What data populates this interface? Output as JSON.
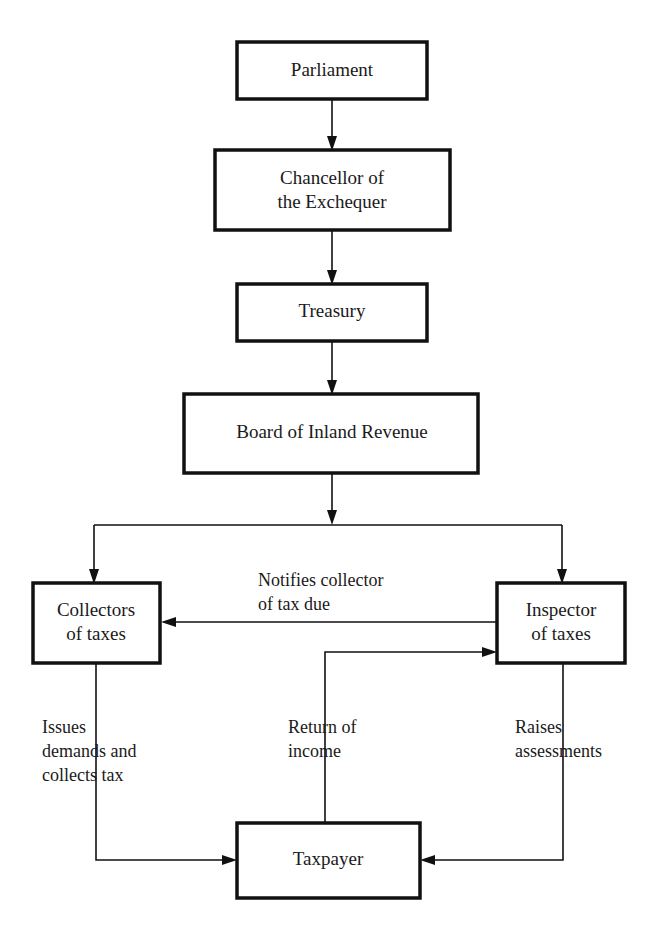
{
  "diagram": {
    "ink_color": "#111111",
    "background_color": "#ffffff",
    "nodes": [
      {
        "id": "parliament",
        "label": "Parliament",
        "lines": [
          "Parliament"
        ],
        "x": 237,
        "y": 42,
        "w": 190,
        "h": 57,
        "border": 3.5
      },
      {
        "id": "chancellor",
        "label": "Chancellor of the Exchequer",
        "lines": [
          "Chancellor of",
          "the Exchequer"
        ],
        "x": 215,
        "y": 150,
        "w": 235,
        "h": 80,
        "border": 3.5
      },
      {
        "id": "treasury",
        "label": "Treasury",
        "lines": [
          "Treasury"
        ],
        "x": 237,
        "y": 284,
        "w": 190,
        "h": 57,
        "border": 3.5
      },
      {
        "id": "board",
        "label": "Board of Inland Revenue",
        "lines": [
          "Board of Inland Revenue"
        ],
        "x": 184,
        "y": 394,
        "w": 294,
        "h": 79,
        "border": 3.5
      },
      {
        "id": "collectors",
        "label": "Collectors of taxes",
        "lines": [
          "Collectors",
          "of taxes"
        ],
        "x": 33,
        "y": 583,
        "w": 127,
        "h": 80,
        "border": 3.5
      },
      {
        "id": "inspector",
        "label": "Inspector of taxes",
        "lines": [
          "Inspector",
          "of taxes"
        ],
        "x": 497,
        "y": 583,
        "w": 128,
        "h": 80,
        "border": 3.5
      },
      {
        "id": "taxpayer",
        "label": "Taxpayer",
        "lines": [
          "Taxpayer"
        ],
        "x": 237,
        "y": 823,
        "w": 183,
        "h": 75,
        "border": 3.5
      }
    ],
    "edge_labels": [
      {
        "id": "notifies",
        "lines": [
          "Notifies collector",
          "of tax due"
        ],
        "x": 258,
        "y": 573
      },
      {
        "id": "issues",
        "lines": [
          "Issues",
          "demands and",
          "collects tax"
        ],
        "x": 42,
        "y": 723
      },
      {
        "id": "return",
        "lines": [
          "Return of",
          "income"
        ],
        "x": 288,
        "y": 723
      },
      {
        "id": "raises",
        "lines": [
          "Raises",
          "assessments"
        ],
        "x": 515,
        "y": 723
      }
    ],
    "connectors": [
      {
        "id": "parliament-to-chancellor",
        "from": "parliament",
        "to": "chancellor",
        "arrow": true
      },
      {
        "id": "chancellor-to-treasury",
        "from": "chancellor",
        "to": "treasury",
        "arrow": true
      },
      {
        "id": "treasury-to-board",
        "from": "treasury",
        "to": "board",
        "arrow": true
      },
      {
        "id": "board-to-collectors",
        "from": "board",
        "to": "collectors",
        "arrow": true
      },
      {
        "id": "board-to-inspector",
        "from": "board",
        "to": "inspector",
        "arrow": true
      },
      {
        "id": "inspector-notifies-collectors",
        "from": "inspector",
        "to": "collectors",
        "arrow": true
      },
      {
        "id": "taxpayer-return-to-inspector",
        "from": "taxpayer",
        "to": "inspector",
        "arrow": true
      },
      {
        "id": "collectors-demands-to-taxpayer",
        "from": "collectors",
        "to": "taxpayer",
        "arrow": true
      },
      {
        "id": "inspector-assessments-to-taxpayer",
        "from": "inspector",
        "to": "taxpayer",
        "arrow": true
      }
    ]
  }
}
